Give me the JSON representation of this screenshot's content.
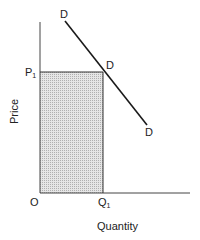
{
  "diagram": {
    "axes": {
      "y_label": "Price",
      "x_label": "Quantity",
      "origin_label": "O"
    },
    "price_level": {
      "label": "P",
      "subscript": "1"
    },
    "quantity_level": {
      "label": "Q",
      "subscript": "1"
    },
    "demand_curve": {
      "label_top": "D",
      "label_mid": "D",
      "label_bottom": "D"
    },
    "shaded_region": "total revenue rectangle P1 × Q1",
    "colors": {
      "line": "#1a1a1a",
      "axis": "#333333",
      "shade": "#d9d9d9"
    }
  }
}
